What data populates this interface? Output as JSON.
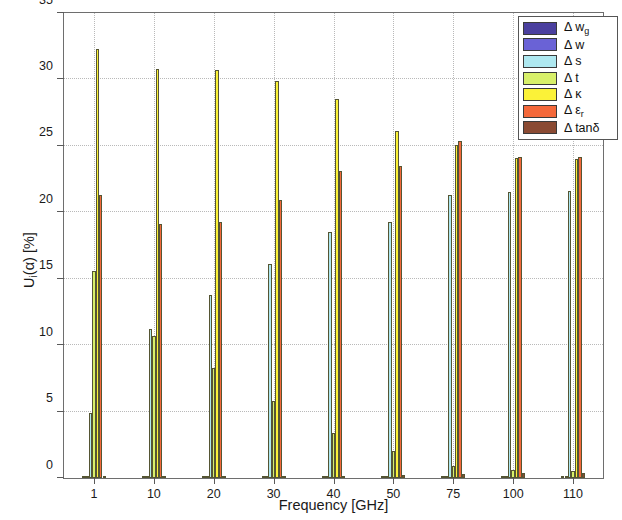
{
  "chart_data": {
    "type": "bar",
    "title": "",
    "xlabel": "Frequency [GHz]",
    "ylabel": "U_i(α) [%]",
    "ylabel_main": "U",
    "ylabel_sub": "i",
    "ylabel_rest": "(α) [%]",
    "categories": [
      "1",
      "10",
      "20",
      "30",
      "40",
      "50",
      "75",
      "100",
      "110"
    ],
    "ylim": [
      0,
      35
    ],
    "yticks": [
      0,
      5,
      10,
      15,
      20,
      25,
      30,
      35
    ],
    "yticklabels": [
      "0",
      "5",
      "10",
      "15",
      "20",
      "25",
      "30",
      "35"
    ],
    "grid": true,
    "grid_style": "dotted",
    "legend_position": "upper right",
    "series": [
      {
        "name": "Δ w_g",
        "label_main": "Δ w",
        "label_sub": "g",
        "color": "#4a3f9e",
        "values": [
          0.05,
          0.05,
          0.05,
          0.05,
          0.05,
          0.05,
          0.05,
          0.05,
          0.05
        ]
      },
      {
        "name": "Δ w",
        "label_main": "Δ w",
        "label_sub": "",
        "color": "#6a62d6",
        "values": [
          0.08,
          0.08,
          0.08,
          0.08,
          0.08,
          0.08,
          0.08,
          0.08,
          0.08
        ]
      },
      {
        "name": "Δ s",
        "label_main": "Δ s",
        "label_sub": "",
        "color": "#aee8f0",
        "values": [
          4.9,
          11.2,
          13.8,
          16.1,
          18.5,
          19.3,
          21.3,
          21.5,
          21.6
        ]
      },
      {
        "name": "Δ t",
        "label_main": "Δ t",
        "label_sub": "",
        "color": "#d8f06a",
        "values": [
          15.6,
          10.7,
          8.3,
          5.8,
          3.4,
          2.0,
          0.9,
          0.6,
          0.5
        ]
      },
      {
        "name": "Δ κ",
        "label_main": "Δ κ",
        "label_sub": "",
        "color": "#fbf238",
        "values": [
          32.3,
          30.8,
          30.7,
          29.9,
          28.5,
          26.1,
          25.1,
          24.1,
          24.0
        ]
      },
      {
        "name": "Δ ε_r",
        "label_main": "Δ ε",
        "label_sub": "r",
        "color": "#f4683a",
        "values": [
          21.3,
          19.1,
          19.3,
          20.9,
          23.1,
          23.5,
          25.4,
          24.2,
          24.2
        ]
      },
      {
        "name": "Δ tanδ",
        "label_main": "Δ tanδ",
        "label_sub": "",
        "color": "#8a4a33",
        "values": [
          0.02,
          0.03,
          0.05,
          0.1,
          0.15,
          0.2,
          0.3,
          0.35,
          0.4
        ]
      }
    ]
  }
}
